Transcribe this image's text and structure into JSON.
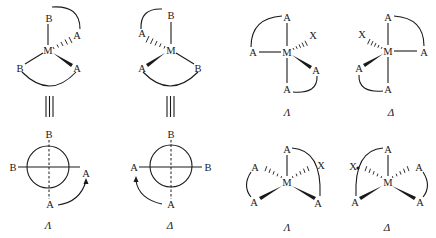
{
  "diagram": {
    "labels": {
      "lambda": "Λ",
      "delta": "Δ"
    },
    "atoms": {
      "metal": "M",
      "ligand_a": "A",
      "ligand_b": "B",
      "ligand_x": "X"
    },
    "panels": [
      {
        "id": "tetrahedral-lambda",
        "type": "perspective + projection",
        "atoms": [
          "B",
          "M",
          "A",
          "B",
          "A",
          "B",
          "B",
          "A",
          "A"
        ],
        "chirality": "Λ"
      },
      {
        "id": "tetrahedral-delta",
        "type": "perspective + projection",
        "atoms": [
          "B",
          "A",
          "M",
          "A",
          "B",
          "B",
          "A",
          "B",
          "A"
        ],
        "chirality": "Δ"
      },
      {
        "id": "octahedral-cis-lambda",
        "atoms": [
          "A",
          "X",
          "A",
          "M",
          "A",
          "A"
        ],
        "chirality": "Λ"
      },
      {
        "id": "octahedral-cis-delta",
        "atoms": [
          "A",
          "X",
          "M",
          "A",
          "A",
          "A"
        ],
        "chirality": "Δ"
      },
      {
        "id": "octahedral-fac-lambda",
        "atoms": [
          "A",
          "A",
          "X",
          "M",
          "A",
          "A"
        ],
        "chirality": "Λ"
      },
      {
        "id": "octahedral-fac-delta",
        "atoms": [
          "A",
          "X",
          "A",
          "M",
          "A",
          "A"
        ],
        "chirality": "Δ"
      }
    ]
  }
}
